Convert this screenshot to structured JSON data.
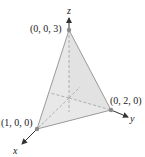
{
  "figure": {
    "type": "tetrahedron-3d",
    "axes": {
      "x_label": "x",
      "y_label": "y",
      "z_label": "z"
    },
    "vertices": [
      {
        "name": "z-intercept",
        "label": "(0, 0, 3)"
      },
      {
        "name": "y-intercept",
        "label": "(0, 2, 0)"
      },
      {
        "name": "x-intercept",
        "label": "(1, 0, 0)"
      }
    ],
    "colors": {
      "face_fill": "#e6e6e6",
      "edge": "#9a9a9a",
      "hidden_axis": "#a8a8a8",
      "axis": "#333333",
      "vertex_dot": "#8a8a8a"
    }
  }
}
